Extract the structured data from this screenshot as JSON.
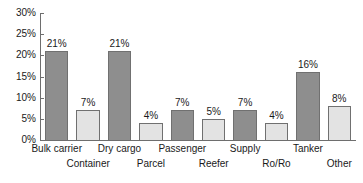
{
  "chart_data": {
    "type": "bar",
    "title": "",
    "xlabel": "",
    "ylabel": "",
    "ylim": [
      0,
      30
    ],
    "grid": false,
    "legend": "none",
    "y_tick_labels": [
      "30%",
      "25%",
      "20%",
      "15%",
      "10%",
      "5%",
      "0%"
    ],
    "y_tick_values": [
      30,
      25,
      20,
      15,
      10,
      5,
      0
    ],
    "categories": [
      "Bulk carrier",
      "Container",
      "Dry cargo",
      "Parcel",
      "Passenger",
      "Reefer",
      "Supply",
      "Ro/Ro",
      "Tanker",
      "Other"
    ],
    "values": [
      21,
      7,
      21,
      4,
      7,
      5,
      7,
      4,
      16,
      8
    ],
    "value_labels": [
      "21%",
      "7%",
      "21%",
      "4%",
      "7%",
      "5%",
      "7%",
      "4%",
      "16%",
      "8%"
    ],
    "bar_styles": [
      "dark",
      "light",
      "dark",
      "light",
      "dark",
      "light",
      "dark",
      "light",
      "dark",
      "light"
    ],
    "label_rows": [
      0,
      1,
      0,
      1,
      0,
      1,
      0,
      1,
      0,
      1
    ],
    "colors": {
      "bar_dark": "#8e8e8e",
      "bar_light": "#e3e3e3",
      "bar_border": "#707070",
      "axis": "#6e6e6e",
      "text": "#1a1a1a",
      "background": "#ffffff"
    }
  }
}
